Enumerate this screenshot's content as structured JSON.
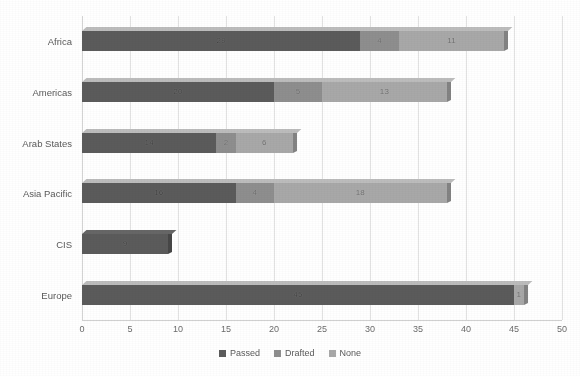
{
  "chart_data": {
    "type": "bar",
    "orientation": "horizontal",
    "stacked": true,
    "title": "",
    "subtitle": "",
    "xlabel": "",
    "ylabel": "",
    "xlim": [
      0,
      50
    ],
    "xticks": [
      0,
      5,
      10,
      15,
      20,
      25,
      30,
      35,
      40,
      45,
      50
    ],
    "xtick_labels": [
      "0",
      "5",
      "10",
      "15",
      "20",
      "25",
      "30",
      "35",
      "40",
      "45",
      "50"
    ],
    "grid": true,
    "grid_axis": "x",
    "legend": {
      "position": "bottom",
      "entries": [
        {
          "label": "Passed",
          "color": "#5b5b5b"
        },
        {
          "label": "Drafted",
          "color": "#8e8e8e"
        },
        {
          "label": "None",
          "color": "#a8a8a8"
        }
      ]
    },
    "categories": [
      "Africa",
      "Americas",
      "Arab States",
      "Asia Pacific",
      "CIS",
      "Europe"
    ],
    "series": [
      {
        "name": "Passed",
        "color": "#5b5b5b",
        "values": [
          29,
          20,
          14,
          16,
          9,
          45
        ]
      },
      {
        "name": "Drafted",
        "color": "#8e8e8e",
        "values": [
          4,
          5,
          2,
          4,
          0,
          0
        ]
      },
      {
        "name": "None",
        "color": "#a8a8a8",
        "values": [
          11,
          13,
          6,
          18,
          0,
          1
        ]
      }
    ],
    "totals": [
      44,
      38,
      22,
      38,
      9,
      46
    ],
    "data_labels": [
      {
        "category": "Africa",
        "labels": [
          "29",
          "4",
          "11"
        ]
      },
      {
        "category": "Americas",
        "labels": [
          "20",
          "5",
          "13"
        ]
      },
      {
        "category": "Arab States",
        "labels": [
          "14",
          "2",
          "6"
        ]
      },
      {
        "category": "Asia Pacific",
        "labels": [
          "16",
          "4",
          "18"
        ]
      },
      {
        "category": "CIS",
        "labels": [
          "9",
          "",
          ""
        ]
      },
      {
        "category": "Europe",
        "labels": [
          "45",
          "",
          "1"
        ]
      }
    ]
  },
  "colors": {
    "background": "#ffffff",
    "grid": "#e2e2e2",
    "axis": "#d0d0d0",
    "text": "#5a5a5a",
    "passed": "#5b5b5b",
    "drafted": "#8e8e8e",
    "none": "#a8a8a8"
  }
}
